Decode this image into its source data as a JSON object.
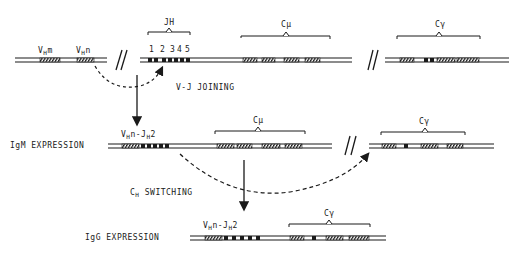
{
  "diagram": {
    "type": "immunoglobulin heavy chain gene rearrangement",
    "germline": {
      "v_segments": [
        "VHm",
        "VHn"
      ],
      "jh_label": "JH",
      "jh_numbers": [
        "1",
        "2",
        "3",
        "4",
        "5"
      ],
      "c_mu_label": "Cμ",
      "c_gamma_label": "Cγ"
    },
    "steps": {
      "vj_joining": "V-J JOINING",
      "ch_switching_main": "C",
      "ch_switching_sub": "H",
      "ch_switching_rest": " SWITCHING"
    },
    "igm": {
      "label": "IgM  EXPRESSION",
      "joined_v": "V",
      "joined_v_sub": "H",
      "joined_mid": "n-J",
      "joined_j_sub": "H",
      "joined_end": "2",
      "c_mu_label": "Cμ",
      "c_gamma_label": "Cγ"
    },
    "igg": {
      "label": "IgG EXPRESSION",
      "joined_v": "V",
      "joined_v_sub": "H",
      "joined_mid": "n-J",
      "joined_j_sub": "H",
      "joined_end": "2",
      "c_gamma_label": "Cγ"
    },
    "vm_main": "V",
    "vm_sub": "H",
    "vm_end": "m",
    "vn_main": "V",
    "vn_sub": "H",
    "vn_end": "n",
    "break_mark": "//",
    "colors": {
      "ink": "#1a1a1a",
      "background": "#ffffff"
    }
  }
}
